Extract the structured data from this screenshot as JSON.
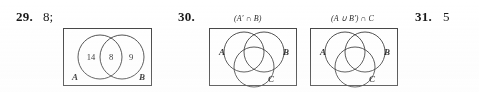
{
  "document": {
    "type": "answer-key-excerpt",
    "background_color": "#ffffff",
    "ink_color": "#111111"
  },
  "answers": [
    {
      "number": "29.",
      "answer_text": "8;",
      "has_diagram": true,
      "diagram_index": 0
    },
    {
      "number": "30.",
      "answer_text": "",
      "has_diagram": true,
      "diagram_index": 1
    },
    {
      "number": "31.",
      "answer_text": "5",
      "has_diagram": false
    }
  ],
  "diagrams": [
    {
      "id": "venn-two-set",
      "caption": "",
      "kind": "two-circle",
      "set_labels": [
        {
          "text": "A",
          "position": "bottom-left"
        },
        {
          "text": "B",
          "position": "bottom-right"
        }
      ],
      "region_values": [
        {
          "text": "14",
          "region": "A-only"
        },
        {
          "text": "8",
          "region": "A-and-B"
        },
        {
          "text": "9",
          "region": "B-only"
        }
      ]
    },
    {
      "id": "venn-three-set-a",
      "caption": "(A′ ∩ B)",
      "kind": "three-circle",
      "set_labels": [
        {
          "text": "A",
          "position": "left"
        },
        {
          "text": "B",
          "position": "right"
        },
        {
          "text": "C",
          "position": "bottom"
        }
      ],
      "region_values": []
    },
    {
      "id": "venn-three-set-b",
      "caption": "(A ∪ B′) ∩ C",
      "kind": "three-circle",
      "set_labels": [
        {
          "text": "A",
          "position": "left"
        },
        {
          "text": "B",
          "position": "right"
        },
        {
          "text": "C",
          "position": "bottom"
        }
      ],
      "region_values": []
    }
  ]
}
